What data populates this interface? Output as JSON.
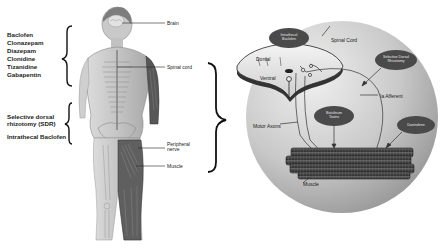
{
  "figure": {
    "left_panel": {
      "pharmacologic_treatments": [
        "Baclofen",
        "Clonazepam",
        "Diazepam",
        "Clonidine",
        "Tizanidine",
        "Gabapentin"
      ],
      "surgical_treatments": [
        "Selective dorsal rhizotomy (SDR)",
        "Intrathecal Baclofen"
      ],
      "surgical_treatments_lines": [
        "Selective dorsal",
        "rhizotomy (SDR)",
        "Intrathecal Baclofen"
      ],
      "anatomy_labels": {
        "brain": "Brain",
        "spinal_cord": "Spinal cord",
        "peripheral_nerve_line1": "Peripheral",
        "peripheral_nerve_line2": "nerve",
        "muscle": "Muscle"
      }
    },
    "right_panel": {
      "cross_section_labels": {
        "dorsal": "Dorsal",
        "ventral": "Ventral",
        "spinal_cord": "Spinal Cord",
        "ia_afferent": "Ia Afferent",
        "motor_axons": "Motor Axons",
        "muscle": "Muscle"
      },
      "treatment_ovals": {
        "intrathecal_baclofen_l1": "Intrathecal",
        "intrathecal_baclofen_l2": "Baclofen",
        "sdr_l1": "Selective Dorsal",
        "sdr_l2": "Rhizotomy",
        "botulinum_l1": "Botulinum",
        "botulinum_l2": "Toxins",
        "dantrolene": "Dantrolene"
      }
    },
    "colors": {
      "background": "#ffffff",
      "circle_light": "#e6e6e6",
      "circle_dark": "#a9a9a9",
      "oval_fill": "#4a4a4a",
      "brace": "#111111",
      "muscle_fill": "#555555"
    }
  }
}
